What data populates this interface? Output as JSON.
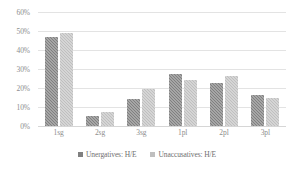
{
  "chart_data": {
    "type": "bar",
    "title": "",
    "subtitle": "",
    "xlabel": "",
    "ylabel": "",
    "categories": [
      "1sg",
      "2sg",
      "3sg",
      "1pl",
      "2pl",
      "3pl"
    ],
    "series": [
      {
        "name": "Unergatives: H/E",
        "color": "#808080",
        "values": [
          47,
          5.5,
          14,
          27.5,
          22.5,
          16.5
        ]
      },
      {
        "name": "Unaccusatives:  H/E",
        "color": "#bfbfbf",
        "values": [
          49,
          7.5,
          19.5,
          24,
          26.5,
          14.5
        ]
      }
    ],
    "ylim": [
      0,
      60
    ],
    "y_ticks": [
      0,
      10,
      20,
      30,
      40,
      50,
      60
    ],
    "y_tick_labels": [
      "0%",
      "10%",
      "20%",
      "30%",
      "40%",
      "50%",
      "60%"
    ],
    "grid": true,
    "grid_axis": "y",
    "legend_position": "bottom"
  },
  "colors": {
    "gridline": "#e3e3e3",
    "baseline": "#d6d6d6",
    "tick_text": "#8d8d8d",
    "legend_text": "#6f6f6f",
    "background": "#ffffff"
  }
}
